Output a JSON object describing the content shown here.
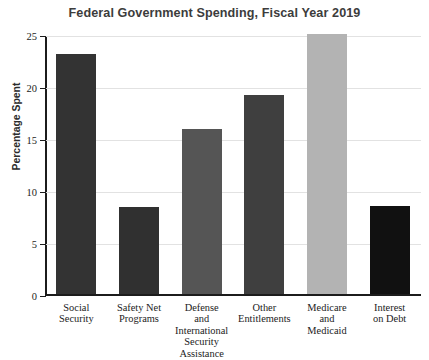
{
  "chart_data": {
    "type": "bar",
    "title": "Federal Government Spending, Fiscal Year 2019",
    "xlabel": "",
    "ylabel": "Percentage Spent",
    "ylim": [
      0,
      25
    ],
    "yticks": [
      0,
      5,
      10,
      15,
      20,
      25
    ],
    "ytick_labels": [
      "0",
      "5",
      "10",
      "15",
      "20",
      "25"
    ],
    "grid": true,
    "legend": "none",
    "categories": [
      "Social Security",
      "Safety Net Programs",
      "Defense and International Security Assistance",
      "Other Entitlements",
      "Medicare and Medicaid",
      "Interest on Debt"
    ],
    "category_label_lines": [
      [
        "Social",
        "Security"
      ],
      [
        "Safety Net",
        "Programs"
      ],
      [
        "Defense",
        "and",
        "International",
        "Security",
        "Assistance"
      ],
      [
        "Other",
        "Entitlements"
      ],
      [
        "Medicare",
        "and",
        "Medicaid"
      ],
      [
        "Interest",
        "on Debt"
      ]
    ],
    "values": [
      23.1,
      8.4,
      15.9,
      19.1,
      25.0,
      8.5
    ],
    "clipped": [
      false,
      false,
      false,
      false,
      true,
      false
    ],
    "bar_colors": [
      "#333333",
      "#303030",
      "#555555",
      "#3f3f3f",
      "#b3b3b3",
      "#111111"
    ]
  },
  "colors": {
    "background": "#ffffff",
    "axis": "#1c1c1c",
    "grid": "#e2e2e2",
    "title_text": "#3c3c3c",
    "axis_text": "#1c1c1c"
  }
}
